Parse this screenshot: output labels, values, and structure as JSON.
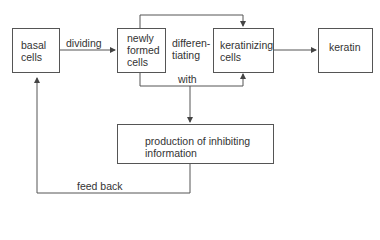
{
  "nodes": {
    "basal": {
      "label": "basal\ncells"
    },
    "newly": {
      "label": "newly\nformed\ncells"
    },
    "keratinizing": {
      "label": "keratinizing\ncells"
    },
    "keratin": {
      "label": "keratin"
    },
    "production": {
      "label": "production of inhibiting\ninformation"
    }
  },
  "edges": {
    "dividing": "dividing",
    "differentiating": "differen-\ntiating",
    "with": "with",
    "feedback": "feed back"
  }
}
